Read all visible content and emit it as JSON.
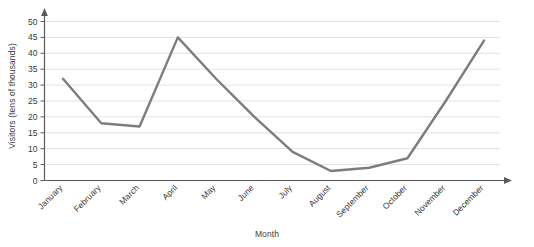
{
  "chart_data": {
    "type": "line",
    "title": "",
    "xlabel": "Month",
    "ylabel": "Visitors (tens of thousands)",
    "categories": [
      "January",
      "February",
      "March",
      "April",
      "May",
      "June",
      "July",
      "August",
      "September",
      "October",
      "November",
      "December"
    ],
    "values": [
      32,
      18,
      17,
      45,
      32,
      20,
      9,
      3,
      4,
      7,
      25,
      44
    ],
    "series": [
      {
        "name": "Visitors",
        "values": [
          32,
          18,
          17,
          45,
          32,
          20,
          9,
          3,
          4,
          7,
          25,
          44
        ]
      }
    ],
    "ylim": [
      0,
      50
    ],
    "ytick_labels": [
      "0",
      "5",
      "10",
      "15",
      "20",
      "25",
      "30",
      "35",
      "40",
      "45",
      "50"
    ],
    "ytick_values": [
      0,
      5,
      10,
      15,
      20,
      25,
      30,
      35,
      40,
      45,
      50
    ],
    "grid": true,
    "grid_axis": "y",
    "legend": false,
    "legend_position": "none",
    "markers": false,
    "xtick_label_rotation": -45,
    "colors": {
      "line": "#7d7d7d",
      "grid": "#e2e2e2",
      "axis": "#5a5a5a",
      "text": "#3a3a3a",
      "background": "#ffffff"
    },
    "line_width": 2.4
  }
}
